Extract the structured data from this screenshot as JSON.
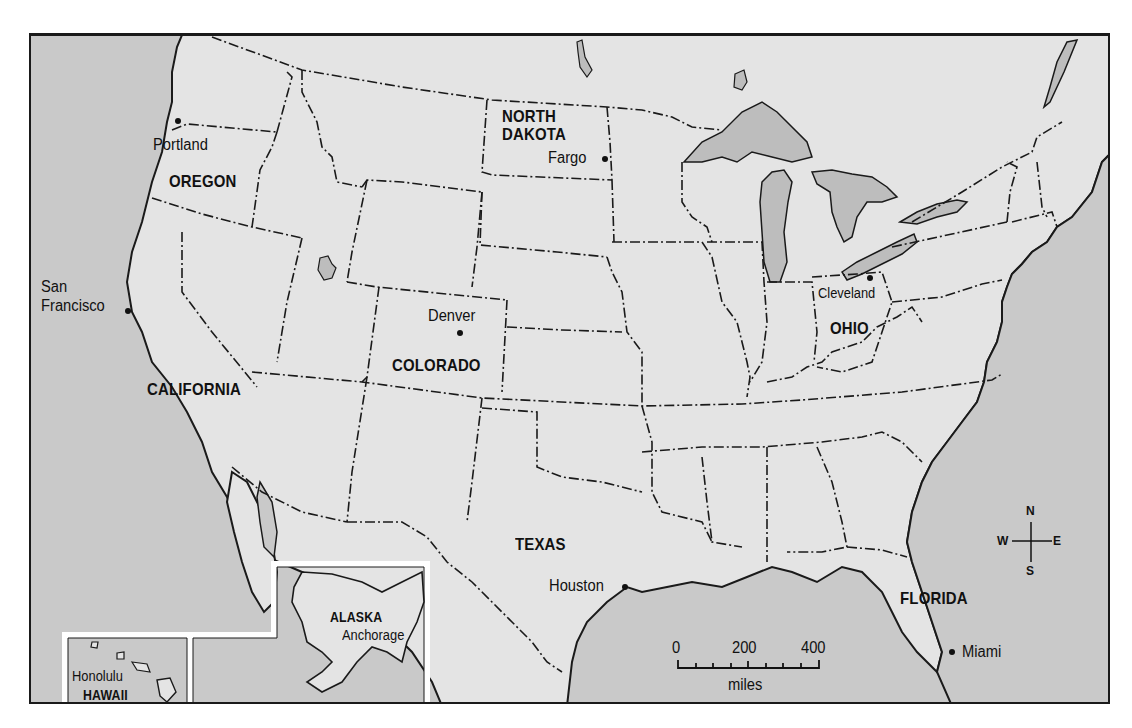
{
  "map": {
    "colors": {
      "water": "#c9c9c9",
      "land": "#e4e4e4",
      "lakes": "#bdbdbd",
      "border": "#1a1a1a",
      "inset_frame": "#ffffff"
    },
    "states": {
      "oregon": "OREGON",
      "north_dakota_line1": "NORTH",
      "north_dakota_line2": "DAKOTA",
      "california": "CALIFORNIA",
      "colorado": "COLORADO",
      "ohio": "OHIO",
      "texas": "TEXAS",
      "florida": "FLORIDA",
      "alaska": "ALASKA",
      "hawaii": "HAWAII"
    },
    "cities": {
      "portland": "Portland",
      "fargo": "Fargo",
      "san_francisco_line1": "San",
      "san_francisco_line2": "Francisco",
      "denver": "Denver",
      "cleveland": "Cleveland",
      "houston": "Houston",
      "miami": "Miami",
      "anchorage": "Anchorage",
      "honolulu": "Honolulu"
    },
    "compass": {
      "n": "N",
      "s": "S",
      "e": "E",
      "w": "W"
    },
    "scale_bar": {
      "tick0": "0",
      "tick200": "200",
      "tick400": "400",
      "unit": "miles"
    }
  }
}
